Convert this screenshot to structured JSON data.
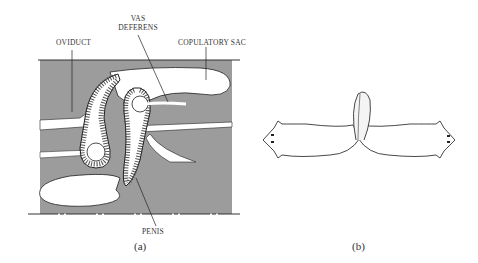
{
  "panel_a": {
    "labels": {
      "oviduct": "OVIDUCT",
      "vas_deferens_line1": "VAS",
      "vas_deferens_line2": "DEFERENS",
      "copulatory_sac": "COPULATORY SAC",
      "penis": "PENIS"
    },
    "caption": "(a)",
    "colors": {
      "tissue": "#9a9a9a",
      "lumen": "#ffffff",
      "outline": "#222222"
    }
  },
  "panel_b": {
    "caption": "(b)"
  }
}
